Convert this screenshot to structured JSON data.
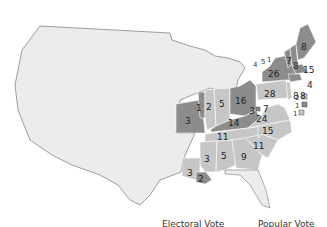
{
  "map": {
    "colors": {
      "background": "#ffffff",
      "territory": "#ececec",
      "candidate_a": "#8c8c8c",
      "candidate_b": "#c6c6c6",
      "border": "#ffffff",
      "outline": "#777777"
    },
    "states": [
      {
        "abbr": "ME",
        "ev": "8",
        "side": "a"
      },
      {
        "abbr": "NH",
        "ev": "7",
        "side": "a"
      },
      {
        "abbr": "VT",
        "ev": "8",
        "side": "a"
      },
      {
        "abbr": "MA",
        "ev": "15",
        "side": "a"
      },
      {
        "abbr": "RI",
        "ev": "4",
        "side": "a"
      },
      {
        "abbr": "CT",
        "ev": "8",
        "side": "a"
      },
      {
        "abbr": "NY",
        "ev": "26",
        "side": "a"
      },
      {
        "abbr": "NY_split_1",
        "ev": "4",
        "side": "a"
      },
      {
        "abbr": "NY_split_2",
        "ev": "5",
        "side": "b"
      },
      {
        "abbr": "NY_split_3",
        "ev": "1",
        "side": "b"
      },
      {
        "abbr": "NJ",
        "ev": "8",
        "side": "b"
      },
      {
        "abbr": "PA",
        "ev": "28",
        "side": "b"
      },
      {
        "abbr": "DE",
        "ev": "2",
        "side": "b"
      },
      {
        "abbr": "MD_a",
        "ev": "1",
        "side": "a"
      },
      {
        "abbr": "MD_b",
        "ev": "1",
        "side": "b"
      },
      {
        "abbr": "MD_inland",
        "ev": "3",
        "side": "a"
      },
      {
        "abbr": "MD_inland_b",
        "ev": "7",
        "side": "b"
      },
      {
        "abbr": "VA",
        "ev": "24",
        "side": "b"
      },
      {
        "abbr": "NC",
        "ev": "15",
        "side": "b"
      },
      {
        "abbr": "SC",
        "ev": "11",
        "side": "b"
      },
      {
        "abbr": "GA",
        "ev": "9",
        "side": "b"
      },
      {
        "abbr": "AL",
        "ev": "5",
        "side": "b"
      },
      {
        "abbr": "MS",
        "ev": "3",
        "side": "b"
      },
      {
        "abbr": "LA_b",
        "ev": "3",
        "side": "b"
      },
      {
        "abbr": "LA_a",
        "ev": "2",
        "side": "a"
      },
      {
        "abbr": "TN",
        "ev": "11",
        "side": "b"
      },
      {
        "abbr": "KY",
        "ev": "14",
        "side": "a"
      },
      {
        "abbr": "OH",
        "ev": "16",
        "side": "a"
      },
      {
        "abbr": "IN",
        "ev": "5",
        "side": "b"
      },
      {
        "abbr": "IL",
        "ev": "2",
        "side": "b"
      },
      {
        "abbr": "IL_split",
        "ev": "1",
        "side": "a"
      },
      {
        "abbr": "MO",
        "ev": "3",
        "side": "a"
      }
    ]
  },
  "legend": {
    "electoral_label": "Electoral Vote",
    "popular_label": "Popular Vote"
  }
}
